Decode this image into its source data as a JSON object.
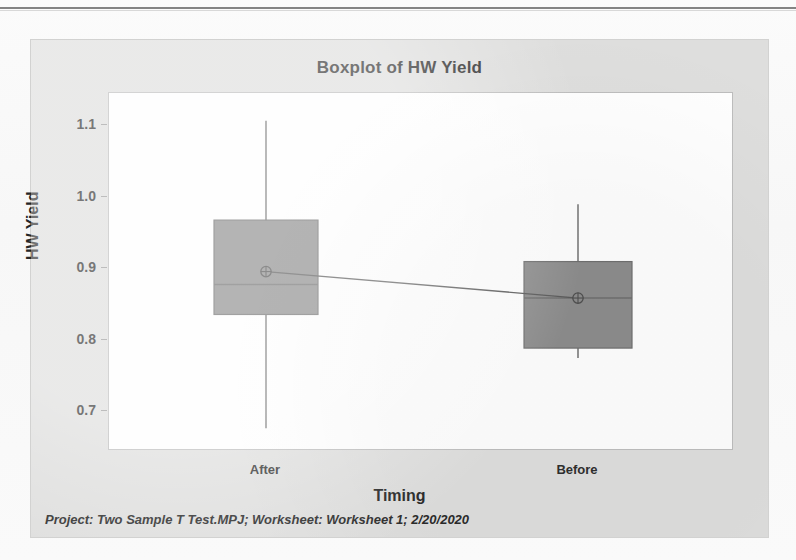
{
  "window": {
    "title": "Boxplot of HW Yield"
  },
  "footer": {
    "text": "Project: Two Sample T Test.MPJ; Worksheet: Worksheet 1; 2/20/2020"
  },
  "colors": {
    "box_fill": "#8c8c8c",
    "box_edge": "#6f6f6f",
    "whisker": "#7a7a7a",
    "mean_line": "#595959",
    "plot_background": "#fefefe",
    "graph_background": "#dededd",
    "axis": "#bdbdbd",
    "text": "#2e2e2e"
  },
  "chart_data": {
    "type": "box",
    "title": "Boxplot of HW Yield",
    "xlabel": "Timing",
    "ylabel": "HW Yield",
    "categories": [
      "After",
      "Before"
    ],
    "ytick_labels": [
      "1.1",
      "1.0",
      "0.9",
      "0.8",
      "0.7"
    ],
    "yticks": [
      1.1,
      1.0,
      0.9,
      0.8,
      0.7
    ],
    "ylim": [
      0.66,
      1.14
    ],
    "grid": false,
    "legend": null,
    "mean_connect_line": true,
    "boxes": [
      {
        "category": "After",
        "whisker_low": 0.676,
        "q1": 0.835,
        "median": 0.877,
        "q3": 0.967,
        "whisker_high": 1.106,
        "mean": 0.895
      },
      {
        "category": "Before",
        "whisker_low": 0.774,
        "q1": 0.788,
        "median": 0.858,
        "q3": 0.909,
        "whisker_high": 0.989,
        "mean": 0.858
      }
    ]
  },
  "axes": {
    "y_ticks": [
      {
        "label": "1.1",
        "value": 1.1
      },
      {
        "label": "1.0",
        "value": 1.0
      },
      {
        "label": "0.9",
        "value": 0.9
      },
      {
        "label": "0.8",
        "value": 0.8
      },
      {
        "label": "0.7",
        "value": 0.7
      }
    ],
    "x_ticks": [
      {
        "label": "After"
      },
      {
        "label": "Before"
      }
    ],
    "y_title": "HW Yield",
    "x_title": "Timing"
  }
}
